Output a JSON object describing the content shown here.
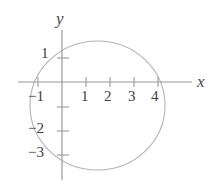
{
  "figure": {
    "kind": "coordinate-plane-with-conic",
    "background_color": "#ffffff",
    "axis_color": "#9a9a9a",
    "curve_color": "#b0b0b0",
    "text_color": "#3d3d3d",
    "axis_label_color": "#4a4a4a"
  },
  "axes": {
    "x_axis_label": "x",
    "y_axis_label": "y",
    "origin_px": {
      "x": 62,
      "y": 82
    },
    "unit_px": {
      "x": 24,
      "y": 24.5
    },
    "x_axis_line_px": {
      "x1": 18,
      "y1": 82,
      "x2": 192,
      "y2": 82
    },
    "y_axis_line_px": {
      "x1": 62,
      "y1": 30,
      "x2": 62,
      "y2": 180
    },
    "x_range": [
      -2,
      5.4
    ],
    "y_range": [
      -4,
      2.1
    ]
  },
  "ticks": {
    "x": [
      {
        "value": -1,
        "label": "-1",
        "px": 38
      },
      {
        "value": 1,
        "label": "1",
        "px": 86
      },
      {
        "value": 2,
        "label": "2",
        "px": 110
      },
      {
        "value": 3,
        "label": "3",
        "px": 134
      },
      {
        "value": 4,
        "label": "4",
        "px": 158
      }
    ],
    "y": [
      {
        "value": 1,
        "label": "1",
        "px": 58
      },
      {
        "value": -1,
        "label": "",
        "px": 107
      },
      {
        "value": -2,
        "label": "-2",
        "px": 131
      },
      {
        "value": -3,
        "label": "-3",
        "px": 155
      }
    ],
    "tick_half_length_px": 5
  },
  "tick_labels": [
    {
      "name": "y-tick-label-1",
      "text": "1",
      "left": 41,
      "top": 46
    },
    {
      "name": "x-tick-label-neg1",
      "text": "−1",
      "left": 28,
      "top": 89
    },
    {
      "name": "x-tick-label-1",
      "text": "1",
      "left": 81,
      "top": 89
    },
    {
      "name": "x-tick-label-2",
      "text": "2",
      "left": 104,
      "top": 89
    },
    {
      "name": "x-tick-label-3",
      "text": "3",
      "left": 128,
      "top": 89
    },
    {
      "name": "x-tick-label-4",
      "text": "4",
      "left": 151,
      "top": 89
    },
    {
      "name": "y-tick-label-neg2",
      "text": "−2",
      "left": 28,
      "top": 121
    },
    {
      "name": "y-tick-label-neg3",
      "text": "−3",
      "left": 28,
      "top": 145
    }
  ],
  "chart_data": {
    "type": "line",
    "title": "",
    "xlabel": "x",
    "ylabel": "y",
    "grid": false,
    "legend": null,
    "xlim": [
      -2,
      5.4
    ],
    "ylim": [
      -4,
      2.1
    ],
    "xticks": [
      -1,
      1,
      2,
      3,
      4
    ],
    "yticks": [
      1,
      -1,
      -2,
      -3
    ],
    "xticklabels": [
      "-1",
      "1",
      "2",
      "3",
      "4"
    ],
    "yticklabels": [
      "1",
      "",
      "-2",
      "-3"
    ],
    "series": [
      {
        "name": "ellipse",
        "shape": "ellipse",
        "closed": true,
        "center": [
          1.48,
          -0.96
        ],
        "semi_axis_x": 2.81,
        "semi_axis_y": 2.63,
        "center_px": [
          97.5,
          105.5
        ],
        "radius_px": [
          67.5,
          64.5
        ],
        "x_intercepts_approx": [
          -1.33,
          4.29
        ],
        "y_extremes_approx": [
          1.67,
          -3.59
        ],
        "color": "#b0b0b0",
        "linewidth": 1.1
      }
    ]
  }
}
